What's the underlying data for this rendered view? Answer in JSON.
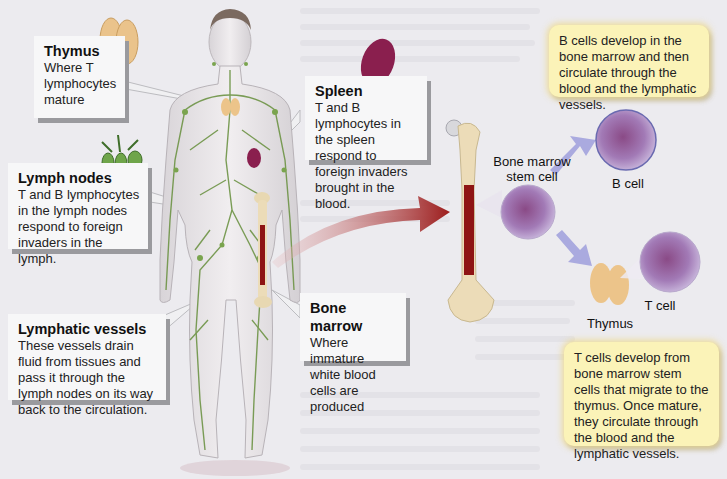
{
  "figure": {
    "colors": {
      "lymph_vessel": "#5e8a3a",
      "thymus": "#e9c48e",
      "spleen": "#8a1f4e",
      "marrow": "#8e1414",
      "bone": "#ecdcb8",
      "cell_purple": "#8c5aa0",
      "note_yellow": "#fbf3b8",
      "arrow_red": "#9c1c1c",
      "arrow_lavender": "#a6a6dc"
    }
  },
  "callouts": {
    "thymus": {
      "title": "Thymus",
      "body": "Where T lymphocytes mature"
    },
    "lymph_nodes": {
      "title": "Lymph nodes",
      "body": "T and B lymphocytes in the lymph nodes respond to foreign invaders in the lymph."
    },
    "lymphatic_vessels": {
      "title": "Lymphatic vessels",
      "body": "These vessels drain fluid from tissues and pass it through the lymph nodes on its way back to the circulation."
    },
    "spleen": {
      "title": "Spleen",
      "body": "T and B lymphocytes in the spleen respond to foreign invaders brought in the blood."
    },
    "bone_marrow": {
      "title": "Bone marrow",
      "body": "Where immature white blood cells are produced"
    }
  },
  "notes": {
    "b_cells": "B cells develop in the bone marrow and then circulate through the blood and the lymphatic vessels.",
    "t_cells": "T cells develop from bone marrow stem cells that migrate to the thymus. Once mature, they circulate through the blood and the lymphatic vessels."
  },
  "labels": {
    "stem_cell": "Bone marrow stem cell",
    "b_cell": "B cell",
    "t_cell": "T cell",
    "thymus": "Thymus"
  }
}
